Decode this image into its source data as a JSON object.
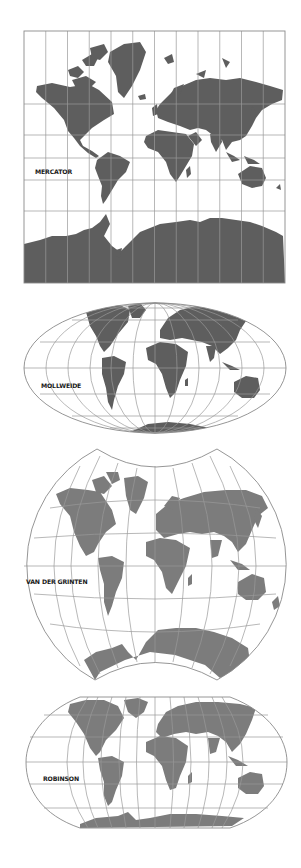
{
  "figure": {
    "colors": {
      "background": "#ffffff",
      "land_dark": "#5e5e5e",
      "land_light": "#7c7c7c",
      "graticule": "#9a9a9a",
      "label": "#1a1a1a"
    },
    "projections": [
      {
        "id": "mercator",
        "label": "MERCATOR",
        "shape": "rectangle",
        "bounds": {
          "x": 24,
          "y": 31,
          "width": 261,
          "height": 252
        },
        "meridian_count": 12,
        "parallels_y": [
          104,
          135,
          158,
          180,
          211
        ],
        "label_pos": {
          "x": 35,
          "y": 172
        }
      },
      {
        "id": "mollweide",
        "label": "MOLLWEIDE",
        "shape": "ellipse",
        "bounds": {
          "cx": 155,
          "cy": 368,
          "rx": 131,
          "ry": 65
        },
        "parallels_y": [
          320,
          342,
          368,
          394,
          416
        ],
        "label_pos": {
          "x": 41,
          "y": 386
        }
      },
      {
        "id": "van-der-grinten",
        "label": "VAN DER GRINTEN",
        "shape": "truncated-circle",
        "bounds": {
          "cx": 155,
          "cy": 566,
          "r": 131,
          "top_y": 449,
          "bottom_y": 680
        },
        "label_pos": {
          "x": 26,
          "y": 582
        }
      },
      {
        "id": "robinson",
        "label": "ROBINSON",
        "shape": "pseudo-cylindrical",
        "bounds": {
          "x": 26,
          "y": 697,
          "width": 261,
          "height": 131
        },
        "parallels_y": [
          715,
          737,
          760,
          784,
          808
        ],
        "label_pos": {
          "x": 43,
          "y": 779
        }
      }
    ]
  }
}
